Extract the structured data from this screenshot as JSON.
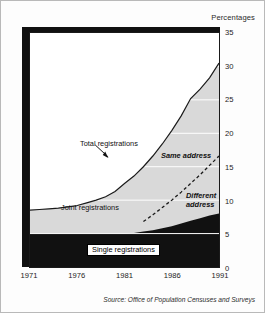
{
  "unit_label": "Percentages",
  "source": "Source: Office of Population Censuses and Surveys",
  "annotations": {
    "total": "Total registrations",
    "same_address": "Same address",
    "different_address": "Different address",
    "joint": "Joint registrations",
    "single": "Single registrations"
  },
  "chart_data": {
    "type": "area",
    "title": "",
    "subtitle": "",
    "xlabel": "",
    "ylabel": "Percentages",
    "xlim": [
      1971,
      1991
    ],
    "ylim": [
      0,
      35
    ],
    "xticks": [
      1971,
      1976,
      1981,
      1986,
      1991
    ],
    "yticks": [
      0,
      5,
      10,
      15,
      20,
      25,
      30,
      35
    ],
    "grid": "horizontal white gridlines visible inside shaded band only",
    "legend": "inline annotations inside plot area",
    "x": [
      1971,
      1972,
      1973,
      1974,
      1975,
      1976,
      1977,
      1978,
      1979,
      1980,
      1981,
      1982,
      1983,
      1984,
      1985,
      1986,
      1987,
      1988,
      1989,
      1990,
      1991
    ],
    "series": [
      {
        "name": "Single registrations",
        "note": "black band, lower area",
        "fill": "#111111",
        "values": [
          5.0,
          5.0,
          5.0,
          5.0,
          5.0,
          5.0,
          5.0,
          5.0,
          5.0,
          5.0,
          5.0,
          5.1,
          5.3,
          5.5,
          5.8,
          6.1,
          6.5,
          6.9,
          7.3,
          7.7,
          8.0
        ]
      },
      {
        "name": "Joint registrations",
        "note": "grey band between single registrations and total registrations line",
        "fill": "#d9d9d9",
        "values": [
          8.5,
          8.6,
          8.7,
          8.8,
          9.0,
          9.2,
          9.6,
          10.0,
          10.5,
          11.3,
          12.5,
          13.6,
          15.0,
          16.6,
          18.4,
          20.4,
          22.6,
          25.2,
          26.6,
          28.3,
          30.5
        ]
      },
      {
        "name": "Total registrations",
        "note": "upper solid boundary line of the shaded area",
        "stroke": "#1a1a1a",
        "values": [
          8.5,
          8.6,
          8.7,
          8.8,
          9.0,
          9.2,
          9.6,
          10.0,
          10.5,
          11.3,
          12.5,
          13.6,
          15.0,
          16.6,
          18.4,
          20.4,
          22.6,
          25.2,
          26.6,
          28.3,
          30.5
        ]
      },
      {
        "name": "Different address",
        "note": "dashed line starting about 1983",
        "stroke": "#1a1a1a",
        "style": "dashed",
        "x": [
          1983,
          1984,
          1985,
          1986,
          1987,
          1988,
          1989,
          1990,
          1991
        ],
        "values": [
          6.8,
          7.8,
          8.9,
          10.0,
          11.2,
          12.5,
          13.8,
          15.2,
          16.6
        ]
      }
    ]
  },
  "colors": {
    "band_single": "#111111",
    "band_joint": "#d9d9d9",
    "line": "#1a1a1a",
    "plot_background": "#ffffff",
    "figure_border": "#b9b9b9"
  }
}
